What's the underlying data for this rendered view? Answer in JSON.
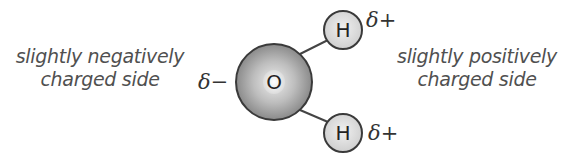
{
  "diagram": {
    "left_label": {
      "line1": "slightly negatively",
      "line2": "charged side"
    },
    "right_label": {
      "line1": "slightly positively",
      "line2": "charged side"
    },
    "atoms": [
      {
        "symbol": "O",
        "charge": "δ−",
        "cx": 274,
        "cy": 82,
        "r": 38
      },
      {
        "symbol": "H",
        "charge": "δ+",
        "cx": 343,
        "cy": 30,
        "r": 20
      },
      {
        "symbol": "H",
        "charge": "δ+",
        "cx": 343,
        "cy": 133,
        "r": 20
      }
    ],
    "colors": {
      "oxygen_center": "#e6e6e6",
      "oxygen_edge": "#8c8c8c",
      "hydrogen_fill": "#e2e2e2",
      "outline": "#3a3a3a",
      "text": "#505050"
    }
  }
}
